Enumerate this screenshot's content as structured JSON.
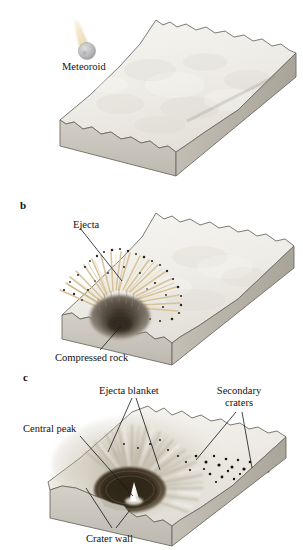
{
  "figure": {
    "background_color": "#ffffff",
    "panel_count": 3
  },
  "palette": {
    "background": "#ffffff",
    "ground_top": "#f1f0ec",
    "ground_top_shade": "#e2e0d8",
    "ground_front": "#c9c5bc",
    "ground_right": "#b3aea4",
    "outline": "#6d6a63",
    "label_text": "#121212",
    "leader_line": "#15161a",
    "meteoroid_body": "#b9b9bb",
    "meteoroid_trail": "#e6d5a8",
    "ejecta_ray": "#d9c398",
    "ejecta_dark_speck": "#2a2418",
    "compressed_rock": "#6b6257",
    "crater_floor": "#413528",
    "central_peak": "#efefe9",
    "secondary_crater_dot": "#14120d"
  },
  "panels": [
    {
      "id": "a",
      "letter": "",
      "caption": "Meteoroid approaching flat ground surface",
      "labels": [
        {
          "name": "meteoroid",
          "text": "Meteoroid",
          "x": 62,
          "y": 62
        }
      ]
    },
    {
      "id": "b",
      "letter": "b",
      "caption": "Impact excavates crater, ejecta thrown out, rock compressed",
      "labels": [
        {
          "name": "ejecta",
          "text": "Ejecta",
          "x": 73,
          "y": 228
        },
        {
          "name": "compressed-rock",
          "text": "Compressed rock",
          "x": 55,
          "y": 352
        }
      ]
    },
    {
      "id": "c",
      "letter": "c",
      "caption": "Final crater with central peak, ejecta blanket and secondary craters",
      "labels": [
        {
          "name": "ejecta-blanket",
          "text": "Ejecta blanket",
          "x": 99,
          "y": 390
        },
        {
          "name": "secondary-craters-line1",
          "text": "Secondary",
          "x": 228,
          "y": 390
        },
        {
          "name": "secondary-craters-line2",
          "text": "craters",
          "x": 238,
          "y": 402
        },
        {
          "name": "central-peak",
          "text": "Central peak",
          "x": 53,
          "y": 428
        },
        {
          "name": "crater-wall",
          "text": "Crater wall",
          "x": 86,
          "y": 534
        }
      ]
    }
  ],
  "text": {
    "panel_b_letter": "b",
    "panel_c_letter": "c",
    "meteoroid": "Meteoroid",
    "ejecta": "Ejecta",
    "compressed_rock": "Compressed rock",
    "ejecta_blanket": "Ejecta blanket",
    "secondary_line1": "Secondary",
    "secondary_line2": "craters",
    "central_peak": "Central peak",
    "crater_wall": "Crater wall"
  }
}
